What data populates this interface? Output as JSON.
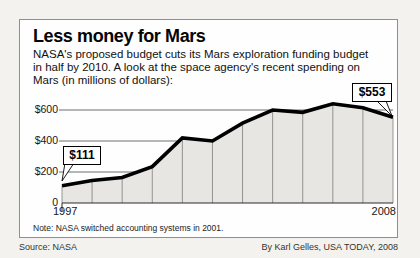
{
  "header": {
    "title": "Less money for Mars",
    "subtitle_lines": [
      "NASA's proposed budget cuts its Mars exploration funding budget",
      "in half by 2010. A look at the space agency's recent spending on",
      "Mars (in millions of dollars):"
    ]
  },
  "chart_data": {
    "type": "area",
    "x": [
      1997,
      1998,
      1999,
      2000,
      2001,
      2002,
      2003,
      2004,
      2005,
      2006,
      2007,
      2008
    ],
    "values": [
      111,
      145,
      165,
      235,
      420,
      400,
      515,
      600,
      585,
      640,
      615,
      553
    ],
    "title": "Less money for Mars",
    "xlabel": "",
    "ylabel": "Spending on Mars (millions of dollars)",
    "ylim": [
      0,
      700
    ],
    "ytick_values": [
      600,
      400,
      200,
      0
    ],
    "ytick_labels": [
      "$600",
      "$400",
      "$200",
      "0"
    ],
    "xtick_labels": [
      "1997",
      "2008"
    ],
    "grid": true,
    "legend": false,
    "annotations": [
      {
        "x": 1997,
        "value": 111,
        "label": "$111"
      },
      {
        "x": 2008,
        "value": 553,
        "label": "$553"
      }
    ]
  },
  "footer": {
    "note": "Note: NASA switched accounting systems in 2001.",
    "source": "Source: NASA",
    "credit": "By Karl Gelles, USA TODAY, 2008"
  },
  "colors": {
    "background": "#f3f2ee",
    "panel": "#fefefe",
    "panel_border": "#8f8f8f",
    "line": "#000000",
    "area_fill": "#e7e6e2",
    "divider": "#6f6f6f",
    "grid": "#4a4a4a",
    "axis": "#2a2a2a"
  }
}
